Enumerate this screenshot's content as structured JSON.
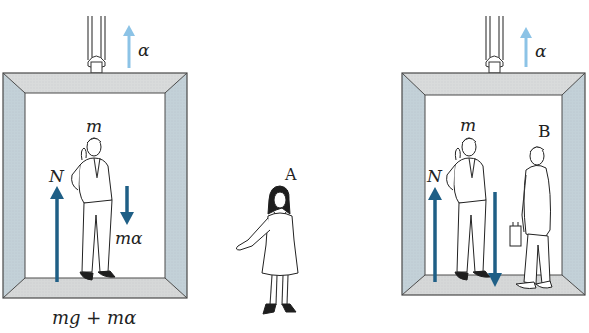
{
  "colors": {
    "force_arrow": "#1f5f86",
    "acceleration_arrow": "#8cc3e6",
    "frame_top": "#d9dbdb",
    "frame_side": "#c3d1d8",
    "frame_floor": "#d6d8d8",
    "frame_edge": "#4a4a4a"
  },
  "left_elevator": {
    "acceleration_label": "α",
    "mass_label": "m",
    "normal_force_label": "N",
    "inertial_force_label": "mα",
    "bottom_equation": "mg + mα"
  },
  "observer_a": {
    "label": "A"
  },
  "right_elevator": {
    "acceleration_label": "α",
    "mass_label": "m",
    "normal_force_label": "N",
    "observer_label": "B"
  }
}
